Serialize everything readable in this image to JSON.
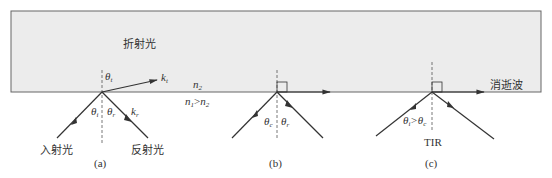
{
  "diagram": {
    "medium": {
      "fill": "#ececec",
      "stroke": "#666666",
      "upper_label": "n2",
      "condition_label": "n1>n2"
    },
    "panels": [
      {
        "id": "a",
        "caption": "(a)",
        "labels": {
          "refracted": "折射光",
          "incident": "入射光",
          "reflected": "反射光",
          "theta_t": "θ",
          "theta_t_sub": "t",
          "theta_i": "θ",
          "theta_i_sub": "i",
          "theta_r": "θ",
          "theta_r_sub": "r",
          "k_t": "k",
          "k_t_sub": "t",
          "k_r": "k",
          "k_r_sub": "r"
        }
      },
      {
        "id": "b",
        "caption": "(b)",
        "labels": {
          "theta_c": "θ",
          "theta_c_sub": "c",
          "theta_r": "θ",
          "theta_r_sub": "r"
        }
      },
      {
        "id": "c",
        "caption": "(c)",
        "labels": {
          "evanescent": "消逝波",
          "condition_theta": "θ",
          "condition_i_sub": "i",
          "condition_gt": ">θ",
          "condition_c_sub": "c",
          "tir": "TIR"
        }
      }
    ],
    "n_labels": {
      "n": "n",
      "sub1": "1",
      "sub2": "2",
      "gt": ">"
    }
  }
}
